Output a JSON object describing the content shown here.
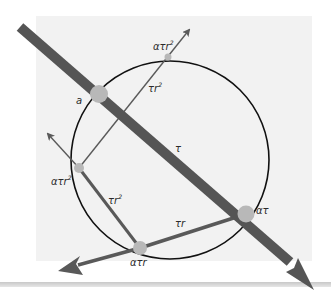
{
  "diagram": {
    "colors": {
      "background": "#ffffff",
      "panel": "#f2f2f2",
      "thick_line": "#555555",
      "medium_line": "#595959",
      "thin_line": "#5a5a5a",
      "circle": "#111111",
      "node": "#b8b8b8",
      "label": "#2a2a2a"
    },
    "points": {
      "a": {
        "label_base": "α",
        "label": "a"
      },
      "at": {
        "label_base": "ατ",
        "label": "ατ"
      },
      "atr": {
        "label_base": "ατr",
        "label": "ατr"
      },
      "atr2_left": {
        "label_base": "ατr",
        "sup": "2",
        "label": "ατr²"
      },
      "atr2_top": {
        "label_base": "ατr",
        "sup": "2",
        "label": "ατr²"
      }
    },
    "segments": {
      "tau": {
        "label": "τ"
      },
      "tau_r": {
        "label": "τr"
      },
      "tau_r2_lower": {
        "label_base": "τr",
        "sup": "2"
      },
      "tau_r2_upper": {
        "label_base": "τr",
        "sup": "2"
      }
    }
  }
}
